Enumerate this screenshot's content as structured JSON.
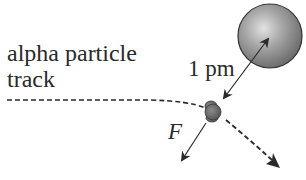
{
  "diagram": {
    "labels": {
      "track_line1": "alpha particle",
      "track_line2": "track",
      "distance": "1 pm",
      "force": "F"
    },
    "elements": {
      "nucleus": "large sphere (nucleus)",
      "alpha_particle": "small particle on track",
      "distance_arrow": "double-headed arrow between nucleus center and alpha particle",
      "force_arrow": "arrow showing repulsive force on alpha particle",
      "track": "dashed trajectory deflected away from nucleus"
    },
    "colors": {
      "nucleus_fill": "#8c8c8c",
      "nucleus_highlight": "#d8d8d8",
      "particle_fill": "#6e6e6e",
      "line": "#2a2a2a"
    }
  }
}
